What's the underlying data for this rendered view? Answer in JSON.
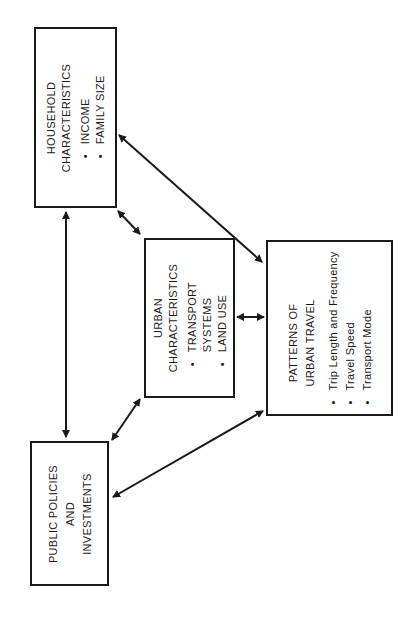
{
  "diagram": {
    "boxes": {
      "household": {
        "title_lines": [
          "HOUSEHOLD",
          "CHARACTERISTICS"
        ],
        "bullets": [
          "INCOME",
          "FAMILY SIZE"
        ]
      },
      "urban": {
        "title_lines": [
          "URBAN",
          "CHARACTERISTICS"
        ],
        "bullets": [
          [
            "TRANSPORT",
            "SYSTEMS"
          ],
          [
            "LAND USE"
          ]
        ]
      },
      "patterns": {
        "title_lines": [
          "PATTERNS OF",
          "URBAN TRAVEL"
        ],
        "bullets": [
          "Trip Length and Frequency",
          "Travel Speed",
          "Transport Mode"
        ]
      },
      "public": {
        "title_lines": [
          "PUBLIC POLICIES",
          "AND",
          "INVESTMENTS"
        ]
      }
    },
    "connections": [
      {
        "from": "household",
        "to": "public",
        "type": "bidirectional"
      },
      {
        "from": "household",
        "to": "urban",
        "type": "bidirectional"
      },
      {
        "from": "household",
        "to": "patterns",
        "type": "bidirectional"
      },
      {
        "from": "urban",
        "to": "patterns",
        "type": "bidirectional"
      },
      {
        "from": "urban",
        "to": "public",
        "type": "bidirectional"
      },
      {
        "from": "public",
        "to": "patterns",
        "type": "bidirectional"
      }
    ],
    "orientation": "rotated -90deg"
  }
}
